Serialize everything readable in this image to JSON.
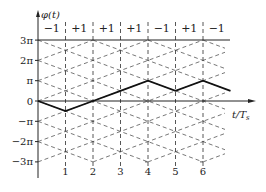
{
  "diagram": {
    "type": "phase-trellis",
    "y_axis": {
      "title": "φ(t)",
      "ticks": [
        "3π",
        "2π",
        "π",
        "0",
        "−π",
        "−2π",
        "−3π"
      ],
      "tick_values_pi": [
        3,
        2,
        1,
        0,
        -1,
        -2,
        -3
      ]
    },
    "x_axis": {
      "title": "t/T",
      "title_subscript": "s",
      "ticks": [
        "1",
        "2",
        "3",
        "4",
        "5",
        "6"
      ],
      "tick_values": [
        1,
        2,
        3,
        4,
        5,
        6
      ]
    },
    "symbols": [
      "−1",
      "+1",
      "+1",
      "+1",
      "−1",
      "+1",
      "−1"
    ],
    "symbol_values": [
      -1,
      1,
      1,
      1,
      -1,
      1,
      -1
    ],
    "phase_path_pi": [
      [
        0,
        0
      ],
      [
        1,
        -0.5
      ],
      [
        2,
        0
      ],
      [
        3,
        0.5
      ],
      [
        4,
        1
      ],
      [
        5,
        0.5
      ],
      [
        6,
        1
      ],
      [
        7,
        0.5
      ]
    ],
    "reference_line_pi": 3,
    "colors": {
      "path": "#111111",
      "grid": "#555555",
      "axis": "#222222"
    }
  }
}
